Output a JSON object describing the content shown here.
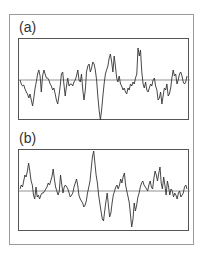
{
  "chart_data": [
    {
      "type": "line",
      "title": "(a)",
      "xlabel": "",
      "ylabel": "",
      "grid": false,
      "baseline": 0,
      "x_step": 2,
      "values": [
        0,
        -4,
        -6,
        -5,
        -9,
        -12,
        -14,
        -18,
        -14,
        -20,
        -26,
        -18,
        -8,
        -2,
        6,
        10,
        4,
        -12,
        4,
        10,
        6,
        2,
        2,
        0,
        -4,
        -6,
        -10,
        -8,
        -14,
        -20,
        -24,
        -16,
        -6,
        6,
        8,
        -4,
        -16,
        -6,
        2,
        -6,
        -4,
        -4,
        -6,
        -2,
        0,
        4,
        10,
        0,
        -2,
        6,
        -10,
        -20,
        -10,
        8,
        14,
        16,
        8,
        12,
        18,
        16,
        10,
        0,
        -16,
        -30,
        -40,
        -30,
        -16,
        -4,
        6,
        10,
        14,
        22,
        26,
        18,
        8,
        24,
        14,
        2,
        -2,
        4,
        -4,
        -6,
        -10,
        -8,
        -12,
        -14,
        -8,
        -10,
        -4,
        -6,
        -2,
        -4,
        2,
        6,
        32,
        24,
        30,
        8,
        -4,
        -8,
        -2,
        -10,
        -12,
        -8,
        -4,
        -6,
        0,
        2,
        -6,
        -10,
        -20,
        -18,
        -12,
        -24,
        -16,
        -8,
        -10,
        -4,
        -16,
        -14,
        -8,
        2,
        10,
        4,
        6,
        -4,
        0,
        6,
        8,
        4,
        -2,
        -4,
        -2,
        4
      ],
      "ylim": [
        -41,
        41
      ]
    },
    {
      "type": "line",
      "title": "(b)",
      "xlabel": "",
      "ylabel": "",
      "grid": false,
      "baseline": 0,
      "x_step": 2,
      "values": [
        2,
        6,
        4,
        10,
        16,
        14,
        20,
        28,
        20,
        10,
        6,
        -4,
        -8,
        4,
        -6,
        -4,
        -8,
        -4,
        -2,
        -2,
        0,
        2,
        4,
        8,
        6,
        10,
        14,
        22,
        12,
        4,
        0,
        -4,
        0,
        16,
        6,
        -2,
        4,
        6,
        4,
        2,
        -2,
        -6,
        -4,
        -2,
        4,
        8,
        12,
        6,
        -4,
        -8,
        -10,
        -12,
        -16,
        -14,
        -10,
        -2,
        4,
        10,
        22,
        34,
        40,
        28,
        16,
        8,
        -4,
        -12,
        -20,
        -28,
        -30,
        -20,
        -10,
        -2,
        -14,
        -26,
        -22,
        -12,
        -4,
        0,
        4,
        6,
        2,
        6,
        12,
        8,
        14,
        18,
        6,
        0,
        -6,
        -12,
        -24,
        -36,
        -28,
        -12,
        -20,
        -14,
        -6,
        -2,
        4,
        8,
        10,
        6,
        4,
        2,
        0,
        6,
        10,
        4,
        2,
        12,
        20,
        16,
        10,
        18,
        24,
        8,
        2,
        14,
        6,
        -4,
        10,
        4,
        -4,
        2,
        0,
        -6,
        -2,
        -4,
        -8,
        -2,
        0,
        -6,
        -4,
        -2,
        4,
        6,
        2
      ],
      "ylim": [
        -41,
        41
      ]
    }
  ],
  "labels": {
    "a": "(a)",
    "b": "(b)"
  },
  "colors": {
    "trace": "#333333",
    "baseline": "#777777",
    "panel_border": "#555555",
    "frame_border": "#9a9a9a"
  }
}
